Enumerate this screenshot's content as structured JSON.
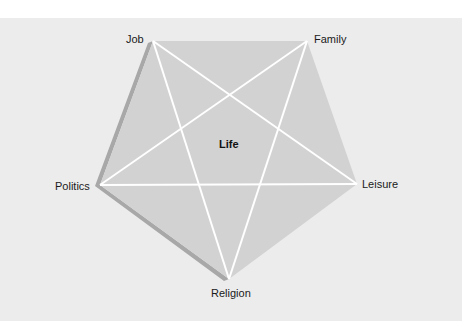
{
  "diagram": {
    "type": "pentagram",
    "center_label": "Life",
    "vertices": [
      {
        "label": "Job",
        "x": 153,
        "y": 41
      },
      {
        "label": "Family",
        "x": 307,
        "y": 41
      },
      {
        "label": "Leisure",
        "x": 357,
        "y": 184
      },
      {
        "label": "Religion",
        "x": 229,
        "y": 279
      },
      {
        "label": "Politics",
        "x": 100,
        "y": 185
      }
    ],
    "colors": {
      "background": "#ececec",
      "pentagon_fill": "#d2d2d2",
      "shadow_edge": "#a8a8a8",
      "star_lines": "#ffffff",
      "text": "#1a1a1a"
    }
  }
}
